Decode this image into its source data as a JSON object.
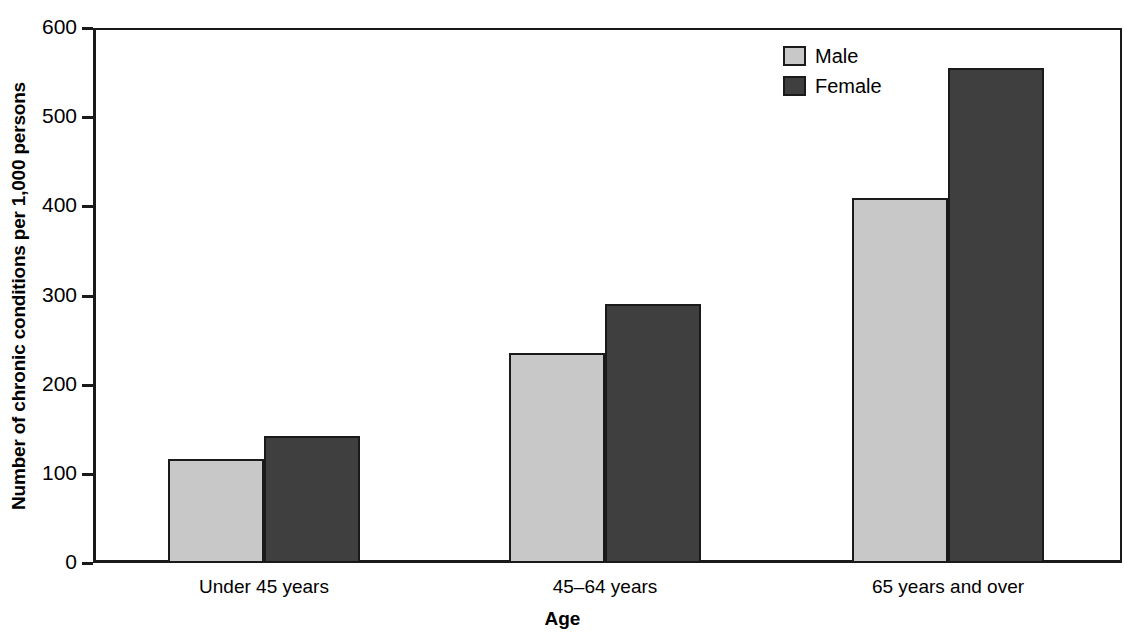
{
  "chart_data": {
    "type": "bar",
    "title": "",
    "xlabel": "Age",
    "ylabel": "Number of chronic conditions per 1,000 persons",
    "categories": [
      "Under 45 years",
      "45–64 years",
      "65 years and over"
    ],
    "series": [
      {
        "name": "Male",
        "values": [
          117,
          236,
          409
        ],
        "color": "#c8c8c8"
      },
      {
        "name": "Female",
        "values": [
          142,
          290,
          555
        ],
        "color": "#3f3f3f"
      }
    ],
    "ylim": [
      0,
      600
    ],
    "yticks": [
      0,
      100,
      200,
      300,
      400,
      500,
      600
    ],
    "ytick_labels": [
      "0",
      "100",
      "200",
      "300",
      "400",
      "500",
      "600"
    ],
    "grid": false,
    "legend_position": "top-right",
    "legend": [
      "Male",
      "Female"
    ]
  },
  "axes": {
    "y_title": "Number of chronic conditions per 1,000 persons",
    "x_title": "Age",
    "ticks": [
      {
        "label": "600",
        "value": 600
      },
      {
        "label": "500",
        "value": 500
      },
      {
        "label": "400",
        "value": 400
      },
      {
        "label": "300",
        "value": 300
      },
      {
        "label": "200",
        "value": 200
      },
      {
        "label": "100",
        "value": 100
      },
      {
        "label": "0",
        "value": 0
      }
    ]
  },
  "legend": {
    "items": [
      {
        "label": "Male",
        "color": "#c8c8c8"
      },
      {
        "label": "Female",
        "color": "#3f3f3f"
      }
    ]
  },
  "categories": [
    {
      "label": "Under 45 years"
    },
    {
      "label": "45–64 years"
    },
    {
      "label": "65 years and over"
    }
  ],
  "colors": {
    "male": "#c8c8c8",
    "female": "#3f3f3f",
    "axis": "#1a1a1a",
    "background": "#ffffff"
  }
}
